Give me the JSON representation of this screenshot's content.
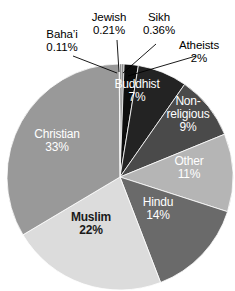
{
  "chart_data": {
    "type": "pie",
    "title": "",
    "categories": [
      "Jewish",
      "Sikh",
      "Atheists",
      "Buddhist",
      "Non-religious",
      "Other",
      "Hindu",
      "Muslim",
      "Christian",
      "Baha'i"
    ],
    "values": [
      0.21,
      0.36,
      2,
      7,
      9,
      11,
      14,
      22,
      33,
      0.11
    ],
    "value_labels": [
      "0.21%",
      "0.36%",
      "2%",
      "7%",
      "9%",
      "11%",
      "14%",
      "22%",
      "33%",
      "0.11%"
    ],
    "unit": "%",
    "legend": "none",
    "start_angle_deg": 0,
    "direction": "clockwise",
    "slices": [
      {
        "name": "Jewish",
        "label": "Jewish",
        "value": 0.21,
        "value_label": "0.21%",
        "color": "#4a4a4a",
        "label_placement": "outside"
      },
      {
        "name": "Sikh",
        "label": "Sikh",
        "value": 0.36,
        "value_label": "0.36%",
        "color": "#8a8a8a",
        "label_placement": "outside"
      },
      {
        "name": "Atheists",
        "label": "Atheists",
        "value": 2,
        "value_label": "2%",
        "color": "#0d0d0d",
        "label_placement": "outside"
      },
      {
        "name": "Buddhist",
        "label": "Buddhist",
        "value": 7,
        "value_label": "7%",
        "color": "#232323",
        "label_placement": "inside",
        "text_color": "#ffffff"
      },
      {
        "name": "Non-religious",
        "label": "Non-religious",
        "label_line1": "Non-",
        "label_line2": "religious",
        "value": 9,
        "value_label": "9%",
        "color": "#4a4a4a",
        "label_placement": "inside",
        "text_color": "#ffffff"
      },
      {
        "name": "Other",
        "label": "Other",
        "value": 11,
        "value_label": "11%",
        "color": "#b5b5b5",
        "label_placement": "inside",
        "text_color": "#ffffff"
      },
      {
        "name": "Hindu",
        "label": "Hindu",
        "value": 14,
        "value_label": "14%",
        "color": "#6a6a6a",
        "label_placement": "inside",
        "text_color": "#ffffff"
      },
      {
        "name": "Muslim",
        "label": "Muslim",
        "value": 22,
        "value_label": "22%",
        "color": "#dcdcdc",
        "label_placement": "inside",
        "text_color": "#1a1a1a"
      },
      {
        "name": "Christian",
        "label": "Christian",
        "value": 33,
        "value_label": "33%",
        "color": "#999999",
        "label_placement": "inside",
        "text_color": "#ffffff"
      },
      {
        "name": "Baha'i",
        "label": "Baha’i",
        "value": 0.11,
        "value_label": "0.11%",
        "color": "#e8e8e8",
        "label_placement": "outside"
      }
    ]
  },
  "outside_labels": {
    "bahai": {
      "name": "Baha’i",
      "value_label": "0.11%"
    },
    "jewish": {
      "name": "Jewish",
      "value_label": "0.21%"
    },
    "sikh": {
      "name": "Sikh",
      "value_label": "0.36%"
    },
    "atheists": {
      "name": "Atheists",
      "value_label": "2%"
    }
  },
  "inside_labels": {
    "buddhist": {
      "name": "Buddhist",
      "value_label": "7%"
    },
    "nonreligious": {
      "line1": "Non-",
      "line2": "religious",
      "value_label": "9%"
    },
    "other": {
      "name": "Other",
      "value_label": "11%"
    },
    "hindu": {
      "name": "Hindu",
      "value_label": "14%"
    },
    "muslim": {
      "name": "Muslim",
      "value_label": "22%"
    },
    "christian": {
      "name": "Christian",
      "value_label": "33%"
    }
  }
}
